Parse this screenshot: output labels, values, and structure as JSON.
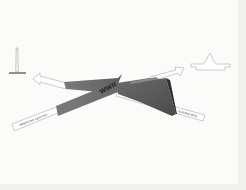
{
  "diagram": {
    "center_label": "WWII",
    "landmarks": {
      "left": "monument-obelisk",
      "right": "capitol-building"
    },
    "paths": {
      "lower_left_label": "AMERICAN CENTURY",
      "lower_right_label": "EISENHOWER",
      "upper_left_band_label": "",
      "upper_right_band_label": ""
    },
    "colors": {
      "background": "#fbfbfa",
      "band_dark": "#6b6b6b",
      "band_mid": "#8a8a8a",
      "wedge_dark": "#5a5a5a",
      "outline": "#9a9a9a"
    }
  }
}
